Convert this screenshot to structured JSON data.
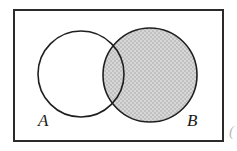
{
  "diagram": {
    "type": "venn",
    "shaded_region": "B",
    "universe": {
      "name": "universal-set-rectangle",
      "label": "",
      "x": 13,
      "y": 9,
      "width": 211,
      "height": 133,
      "stroke": "#2b2b2b",
      "stroke_width": 2,
      "fill": "#ffffff"
    },
    "sets": [
      {
        "id": "A",
        "label": "A",
        "cx": 81,
        "cy": 74,
        "r": 43,
        "shaded": false,
        "fill": "#ffffff",
        "stroke": "#1f1f1f",
        "stroke_width": 1.6,
        "label_x": 38,
        "label_y": 126
      },
      {
        "id": "B",
        "label": "B",
        "cx": 150,
        "cy": 75,
        "r": 47,
        "shaded": true,
        "fill": "#c9c9c9",
        "stroke": "#1f1f1f",
        "stroke_width": 1.6,
        "label_x": 187,
        "label_y": 126
      }
    ],
    "edge_artifact": {
      "name": "cropped-glyph",
      "text": "(",
      "x": 229,
      "y": 136
    },
    "colors": {
      "background": "#ffffff",
      "shade_fill": "#c9c9c9",
      "stipple_light": "#d6d6d6",
      "stipple_dark": "#bdbdbd",
      "outline": "#1f1f1f",
      "frame": "#2b2b2b",
      "label_text": "#1a1a1a"
    }
  }
}
